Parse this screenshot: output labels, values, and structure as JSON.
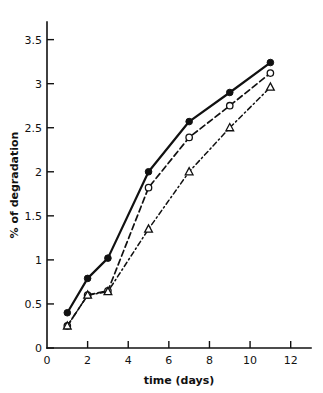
{
  "chart_data": {
    "type": "line",
    "title": "",
    "xlabel": "time (days)",
    "ylabel": "% of degradation",
    "xlim": [
      0,
      13
    ],
    "ylim": [
      0,
      3.7
    ],
    "xticks": [
      0,
      2,
      4,
      6,
      8,
      10,
      12
    ],
    "xtick_labels": [
      "0",
      "2",
      "4",
      "6",
      "8",
      "10",
      "12"
    ],
    "yticks": [
      0,
      0.5,
      1,
      1.5,
      2,
      2.5,
      3,
      3.5
    ],
    "ytick_labels": [
      "0",
      "0.5",
      "1",
      "1.5",
      "2",
      "2.5",
      "3",
      "3.5"
    ],
    "grid": false,
    "legend": "none",
    "x": [
      1,
      2,
      3,
      5,
      7,
      9,
      11
    ],
    "series": [
      {
        "name": "series-filled-circle",
        "marker": "filled-circle",
        "linestyle": "solid",
        "color": "#111111",
        "values": [
          0.4,
          0.79,
          1.02,
          2.0,
          2.57,
          2.9,
          3.24
        ]
      },
      {
        "name": "series-open-circle",
        "marker": "open-circle",
        "linestyle": "dashed",
        "color": "#111111",
        "values": [
          0.25,
          0.6,
          0.65,
          1.82,
          2.39,
          2.75,
          3.12
        ]
      },
      {
        "name": "series-open-triangle",
        "marker": "open-triangle",
        "linestyle": "dash-dot",
        "color": "#111111",
        "values": [
          0.25,
          0.6,
          0.64,
          1.35,
          2.0,
          2.5,
          2.96
        ]
      }
    ]
  }
}
